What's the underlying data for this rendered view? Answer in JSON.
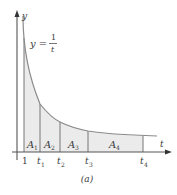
{
  "figure": {
    "caption": "(a)",
    "y_axis_label": "y",
    "t_axis_label": "t",
    "equation": {
      "lhs": "y =",
      "numerator": "1",
      "denominator": "t"
    },
    "tick_labels": [
      "1",
      "t1",
      "t2",
      "t3",
      "t4"
    ],
    "ticks": [
      {
        "base": "1",
        "sub": ""
      },
      {
        "base": "t",
        "sub": "1"
      },
      {
        "base": "t",
        "sub": "2"
      },
      {
        "base": "t",
        "sub": "3"
      },
      {
        "base": "t",
        "sub": "4"
      }
    ],
    "regions": [
      {
        "base": "A",
        "sub": "1"
      },
      {
        "base": "A",
        "sub": "2"
      },
      {
        "base": "A",
        "sub": "3"
      },
      {
        "base": "A",
        "sub": "4"
      }
    ],
    "colors": {
      "fill": "#ebebeb",
      "curve": "#8a8a8a",
      "axis": "#555555",
      "text": "#3a3a3a"
    }
  }
}
